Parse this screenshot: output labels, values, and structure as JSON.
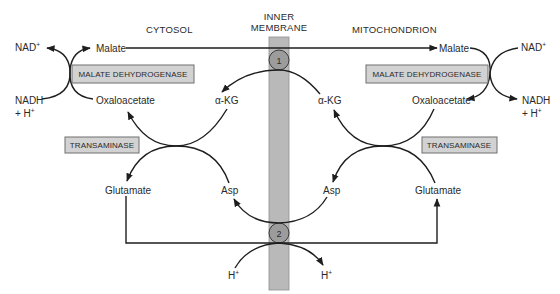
{
  "headers": {
    "cytosol": "CYTOSOL",
    "membrane_line1": "INNER",
    "membrane_line2": "MEMBRANE",
    "mitochondrion": "MITOCHONDRION"
  },
  "transporters": {
    "t1": "1",
    "t2": "2"
  },
  "cytosol": {
    "nad": "NAD",
    "nad_sup": "+",
    "malate": "Malate",
    "enzyme_mdh": "MALATE DEHYDROGENASE",
    "nadh": "NADH",
    "h_plus_prefix": "+ H",
    "h_sup": "+",
    "oxaloacetate": "Oxaloacetate",
    "akg": "α-KG",
    "enzyme_transaminase": "TRANSAMINASE",
    "glutamate": "Glutamate",
    "asp": "Asp",
    "h": "H",
    "h_bottom_sup": "+"
  },
  "mitochondrion": {
    "nad": "NAD",
    "nad_sup": "+",
    "malate": "Malate",
    "enzyme_mdh": "MALATE DEHYDROGENASE",
    "nadh": "NADH",
    "h_plus_prefix": "+ H",
    "h_sup": "+",
    "oxaloacetate": "Oxaloacetate",
    "akg": "α-KG",
    "enzyme_transaminase": "TRANSAMINASE",
    "glutamate": "Glutamate",
    "asp": "Asp",
    "h": "H",
    "h_bottom_sup": "+"
  },
  "colors": {
    "membrane": "#b9b9b9",
    "membrane_edge": "#8f8f8f",
    "enzyme_box": "#d2d2d2",
    "transporter": "#9c9c9c",
    "stroke": "#1e1e1e"
  }
}
